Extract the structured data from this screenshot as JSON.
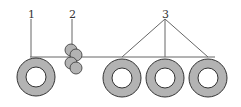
{
  "diagram": {
    "labels": [
      {
        "id": "1",
        "text": "1"
      },
      {
        "id": "2",
        "text": "2"
      },
      {
        "id": "3",
        "text": "3"
      }
    ],
    "colors": {
      "ring_fill": "#b3b3b3",
      "stroke": "#333333",
      "line": "#666666",
      "background": "#ffffff"
    },
    "components": {
      "coil_1": "unwinding coil (1)",
      "rollers_2": "roller pair (2)",
      "coils_3": "winding coils (3)"
    }
  }
}
